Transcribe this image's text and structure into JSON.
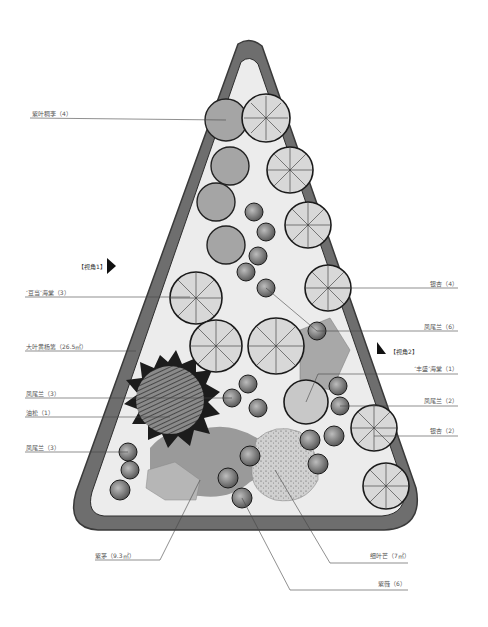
{
  "diagram": {
    "type": "planting-plan",
    "colors": {
      "border": "#6e6e6e",
      "border_dark": "#3a3a3a",
      "ground": "#ececec",
      "shrub_mass": "#9a9a9a",
      "leader": "#444444"
    },
    "labels_left": [
      {
        "text": "紫叶稠李（4）",
        "y": 114
      },
      {
        "text": "‘豆当’海棠（3）",
        "y": 292
      },
      {
        "text": "大叶黄杨篱（26.5㎡）",
        "y": 346
      },
      {
        "text": "凤尾兰（3）",
        "y": 393
      },
      {
        "text": "油松（1）",
        "y": 412
      },
      {
        "text": "凤尾兰（3）",
        "y": 447
      }
    ],
    "labels_right": [
      {
        "text": "银杏（4）",
        "y": 284
      },
      {
        "text": "凤尾兰（6）",
        "y": 327
      },
      {
        "text": "‘丰盛’海棠（1）",
        "y": 368
      },
      {
        "text": "凤尾兰（2）",
        "y": 400
      },
      {
        "text": "银杏（2）",
        "y": 432
      }
    ],
    "labels_bottom": [
      {
        "text": "紫茅（9.3㎡）",
        "x": 95,
        "y": 553
      },
      {
        "text": "细叶芒（7㎡）",
        "x": 370,
        "y": 553
      },
      {
        "text": "紫薇（6）",
        "x": 378,
        "y": 583
      }
    ],
    "view_markers": [
      {
        "text": "【视角1】",
        "x": 78,
        "y": 265
      },
      {
        "text": "【视角2】",
        "x": 390,
        "y": 350
      }
    ]
  }
}
